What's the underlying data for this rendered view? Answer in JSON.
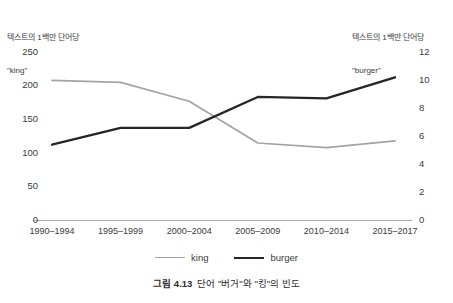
{
  "figure": {
    "caption_number": "그림 4.13",
    "caption_text": "단어 \"버거\"와 \"킹\"의 빈도"
  },
  "left_axis": {
    "caption_line1": "텍스트의 1백만 단어당",
    "caption_line2": "\"king\"",
    "ticks": [
      "250",
      "200",
      "150",
      "100",
      "50",
      "0"
    ]
  },
  "right_axis": {
    "caption_line1": "텍스트의 1백만 단어당",
    "caption_line2": "\"burger\"",
    "ticks": [
      "12",
      "10",
      "8",
      "6",
      "4",
      "2",
      "0"
    ]
  },
  "legend": {
    "items": [
      {
        "label": "king",
        "color": "#a3a3a3"
      },
      {
        "label": "burger",
        "color": "#262626"
      }
    ]
  },
  "chart_data": {
    "type": "line",
    "title": "",
    "xlabel": "",
    "ylabel": "텍스트의 1백만 단어당 \"king\"",
    "y2label": "텍스트의 1백만 단어당 \"burger\"",
    "categories": [
      "1990–1994",
      "1995–1999",
      "2000–2004",
      "2005–2009",
      "2010–2014",
      "2015–2017"
    ],
    "series": [
      {
        "name": "king",
        "axis": "left",
        "color": "#a3a3a3",
        "values": [
          208,
          205,
          177,
          115,
          108,
          118
        ]
      },
      {
        "name": "burger",
        "axis": "right",
        "color": "#262626",
        "values": [
          5.4,
          6.6,
          6.6,
          8.8,
          8.7,
          10.2
        ]
      }
    ],
    "ylim": [
      0,
      250
    ],
    "yticks": [
      0,
      50,
      100,
      150,
      200,
      250
    ],
    "y2lim": [
      0,
      12
    ],
    "y2ticks": [
      0,
      2,
      4,
      6,
      8,
      10,
      12
    ],
    "grid": false,
    "legend_position": "bottom"
  }
}
